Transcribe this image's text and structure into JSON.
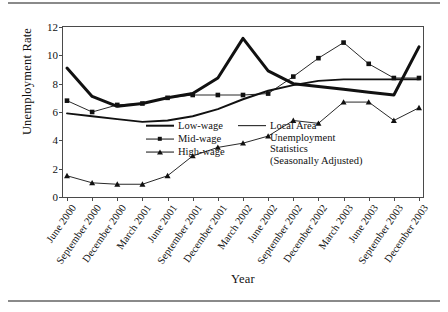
{
  "chart_data": {
    "type": "line",
    "title": "",
    "xlabel": "Year",
    "ylabel": "Unemployment Rate",
    "ylim": [
      0,
      12
    ],
    "yticks": [
      0,
      2,
      4,
      6,
      8,
      10,
      12
    ],
    "grid": false,
    "legend_position": "inside-center",
    "categories": [
      "June 2000",
      "September 2000",
      "December 2000",
      "March 2001",
      "June 2001",
      "September 2001",
      "December 2001",
      "March 2002",
      "June 2002",
      "September 2002",
      "December 2002",
      "March 2003",
      "June 2003",
      "September 2003",
      "December 2003"
    ],
    "series": [
      {
        "name": "Low-wage",
        "style": "thick-line",
        "marker": "none",
        "color": "#111111",
        "values": [
          9.1,
          7.1,
          6.4,
          6.6,
          7.0,
          7.3,
          8.4,
          11.2,
          8.9,
          8.0,
          7.8,
          7.6,
          7.4,
          7.2,
          10.6
        ]
      },
      {
        "name": "Mid-wage",
        "style": "thin-line",
        "marker": "square",
        "color": "#111111",
        "values": [
          6.8,
          6.0,
          6.5,
          6.6,
          7.0,
          7.2,
          7.2,
          7.2,
          7.3,
          8.5,
          9.8,
          10.9,
          9.4,
          8.4,
          8.4
        ]
      },
      {
        "name": "High-wage",
        "style": "thin-line",
        "marker": "triangle",
        "color": "#111111",
        "values": [
          1.5,
          1.0,
          0.9,
          0.9,
          1.5,
          2.9,
          3.5,
          3.8,
          4.3,
          5.4,
          5.2,
          6.7,
          6.7,
          5.4,
          6.3
        ]
      },
      {
        "name": "Local Area Unemployment Statistics (Seasonally Adjusted)",
        "style": "medium-line",
        "marker": "none",
        "color": "#111111",
        "values": [
          5.9,
          5.7,
          5.5,
          5.3,
          5.4,
          5.7,
          6.2,
          6.9,
          7.5,
          7.9,
          8.2,
          8.3,
          8.3,
          8.3,
          8.3
        ]
      }
    ],
    "legend": [
      {
        "label": "Low-wage",
        "swatch": "thick-line"
      },
      {
        "label": "Mid-wage",
        "swatch": "thin-line-square"
      },
      {
        "label": "High-wage",
        "swatch": "thin-line-triangle"
      },
      {
        "label": "Local Area Unemployment Statistics (Seasonally Adjusted)",
        "swatch": "medium-line",
        "lines": [
          "Local Area",
          "Unemployment",
          "Statistics",
          "(Seasonally Adjusted)"
        ]
      }
    ]
  }
}
